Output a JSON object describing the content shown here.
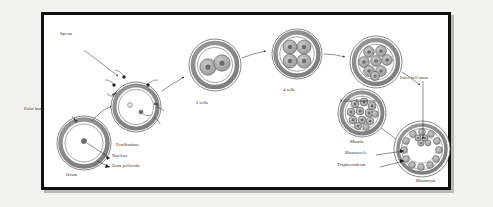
{
  "diagram": {
    "frame": {
      "border_color": "#111111",
      "background": "#ffffff"
    },
    "palette": {
      "zona": "#8c8c8c",
      "cytoplasm": "#ffffff",
      "cell_fill": "#a9a9a9",
      "nucleus": "#6e6e6e",
      "outline": "#444444",
      "text": "#2b2b2b",
      "blastocoele": "#ffffff"
    },
    "labels": {
      "sperm": "Sperm",
      "polar_body": "Polar body",
      "ovum": "Ovum",
      "nucleus": "Nucleus",
      "zona_pellucida": "Zona pellucida",
      "fertilization": "Fertilization",
      "two_cells": "2 cells",
      "four_cells": "4 cells",
      "eight_cells": "8 cells - Blastomere",
      "morula": "Morula",
      "inner_cell_mass": "Inner cell mass",
      "blastocoele": "Blastocoele",
      "trophectoderm": "Trophectoderm",
      "blastocyst": "Blastocyst"
    },
    "stages": [
      {
        "key": "ovum",
        "label": "Ovum",
        "cell_count": 1,
        "order": 1
      },
      {
        "key": "fertilization",
        "label": "Fertilization",
        "cell_count": 1,
        "order": 2
      },
      {
        "key": "two_cells",
        "label": "2 cells",
        "cell_count": 2,
        "order": 3
      },
      {
        "key": "four_cells",
        "label": "4 cells",
        "cell_count": 4,
        "order": 4
      },
      {
        "key": "eight_cells",
        "label": "8 cells - Blastomere",
        "cell_count": 8,
        "order": 5
      },
      {
        "key": "morula",
        "label": "Morula",
        "cell_count": 16,
        "order": 6
      },
      {
        "key": "blastocyst",
        "label": "Blastocyst",
        "cell_count": 32,
        "order": 7
      }
    ],
    "callouts": [
      {
        "key": "sperm",
        "label": "Sperm",
        "points_to": "fertilization"
      },
      {
        "key": "polar_body",
        "label": "Polar body",
        "points_to": "ovum"
      },
      {
        "key": "nucleus",
        "label": "Nucleus",
        "points_to": "ovum"
      },
      {
        "key": "zona_pellucida",
        "label": "Zona pellucida",
        "points_to": "ovum"
      },
      {
        "key": "inner_cell_mass",
        "label": "Inner cell mass",
        "points_to": "blastocyst"
      },
      {
        "key": "blastocoele",
        "label": "Blastocoele",
        "points_to": "blastocyst"
      },
      {
        "key": "trophectoderm",
        "label": "Trophectoderm",
        "points_to": "blastocyst"
      }
    ]
  }
}
